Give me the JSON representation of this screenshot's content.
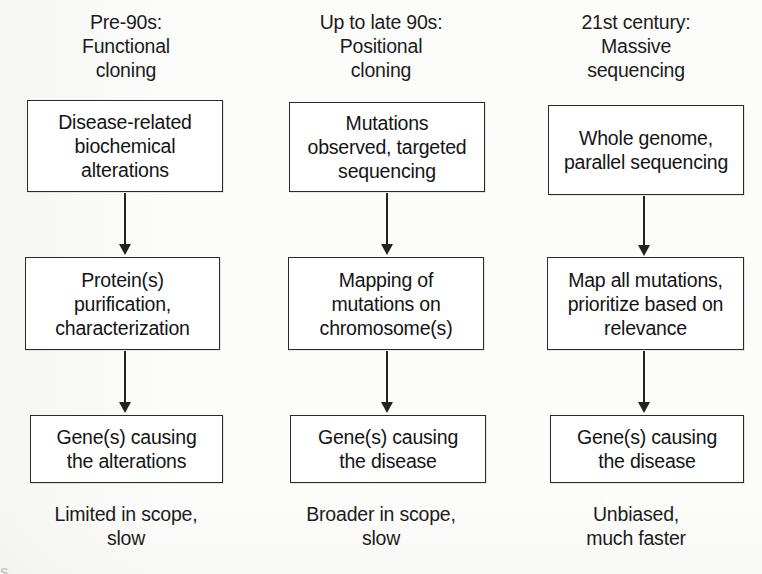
{
  "figure": {
    "background_color": "#fcfcfb",
    "line_color": "#222222",
    "text_color": "#141414"
  },
  "columns": [
    {
      "id": "pre-90s",
      "header": "Pre-90s:\nFunctional\ncloning",
      "steps": [
        "Disease-related\nbiochemical\nalterations",
        "Protein(s)\npurification,\ncharacterization",
        "Gene(s) causing\nthe alterations"
      ],
      "footer": "Limited in scope,\nslow"
    },
    {
      "id": "up-to-late-90s",
      "header": "Up to late 90s:\nPositional\ncloning",
      "steps": [
        "Mutations\nobserved, targeted\nsequencing",
        "Mapping of\nmutations on\nchromosome(s)",
        "Gene(s) causing\nthe disease"
      ],
      "footer": "Broader in scope,\nslow"
    },
    {
      "id": "21st-century",
      "header": "21st century:\nMassive\nsequencing",
      "steps": [
        "Whole genome,\nparallel sequencing",
        "Map all mutations,\nprioritize based on\nrelevance",
        "Gene(s) causing\nthe disease"
      ],
      "footer": "Unbiased,\nmuch faster"
    }
  ],
  "bottom_cut_fragment": "                                                                                                                         s"
}
